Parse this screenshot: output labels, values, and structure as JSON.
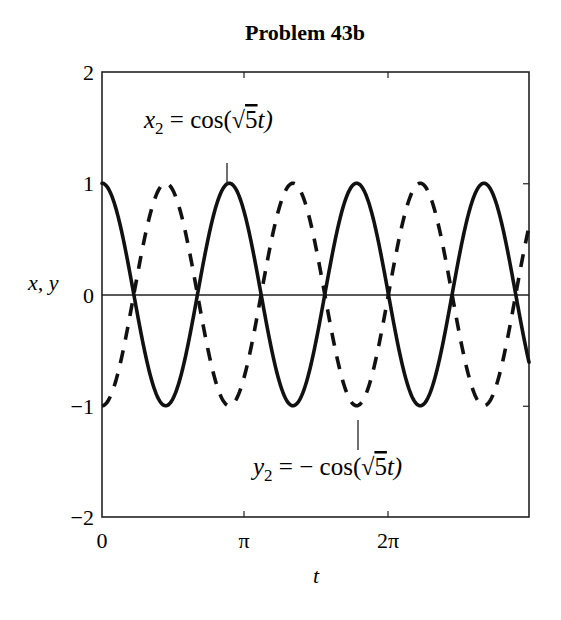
{
  "chart_data": {
    "type": "line",
    "title": "Problem 43b",
    "xlabel": "t",
    "ylabel": "x, y",
    "xlim": [
      0,
      9.42477796
    ],
    "ylim": [
      -2,
      2
    ],
    "xticks": [
      0,
      3.14159265,
      6.28318531
    ],
    "xtick_labels": [
      "0",
      "π",
      "2π"
    ],
    "yticks": [
      -2,
      -1,
      0,
      1,
      2
    ],
    "ytick_labels": [
      "−2",
      "−1",
      "0",
      "1",
      "2"
    ],
    "grid": false,
    "zero_line": true,
    "legend": null,
    "series": [
      {
        "name": "x2 = cos(√5 t)",
        "style": "solid",
        "color": "#111111",
        "function": "cos(sqrt(5)*t)",
        "omega": 2.236068,
        "amplitude": 1,
        "sign": 1
      },
      {
        "name": "y2 = −cos(√5 t)",
        "style": "dashed",
        "color": "#111111",
        "function": "-cos(sqrt(5)*t)",
        "omega": 2.236068,
        "amplitude": 1,
        "sign": -1
      }
    ],
    "annotations": [
      {
        "text_parts": [
          "x",
          "2",
          " = cos(",
          "√",
          "5",
          "t)"
        ],
        "label": "x2 = cos(√5t)",
        "pointer": "solid-curve-peak",
        "approx_t": 2.81,
        "approx_y": 1.0
      },
      {
        "text_parts": [
          "y",
          "2",
          " = − cos(",
          "√",
          "5",
          "t)"
        ],
        "label": "y2 = −cos(√5t)",
        "pointer": "dashed-curve-trough",
        "approx_t": 5.62,
        "approx_y": -1.0
      }
    ]
  },
  "labels": {
    "title": "Problem 43b",
    "xlabel": "t",
    "ylabel": "x, y",
    "x_ticks": [
      "0",
      "π",
      "2π"
    ],
    "y_ticks": [
      "2",
      "1",
      "0",
      "−1",
      "−2"
    ],
    "ann_x2": {
      "var": "x",
      "sub": "2",
      "eq": " = cos(",
      "five": "5",
      "tail": "t)"
    },
    "ann_y2": {
      "var": "y",
      "sub": "2",
      "eq": " = − cos(",
      "five": "5",
      "tail": "t)"
    }
  }
}
